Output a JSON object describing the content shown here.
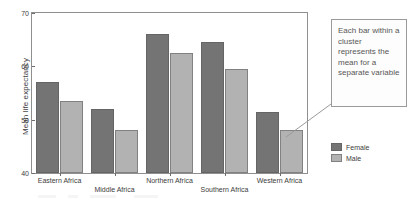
{
  "chart_data": {
    "type": "bar",
    "title": "",
    "subtitle": "",
    "xlabel": "",
    "ylabel": "Mean life expectancy",
    "ylim": [
      40,
      70
    ],
    "yticks": [
      40,
      50,
      60,
      70
    ],
    "ytick_labels": [
      "40",
      "50",
      "60",
      "70"
    ],
    "grid": false,
    "legend_position": "right",
    "categories": [
      "Eastern Africa",
      "Middle Africa",
      "Northern Africa",
      "Southern Africa",
      "Western Africa"
    ],
    "series": [
      {
        "name": "Female",
        "color": "#747474",
        "values": [
          57.0,
          52.0,
          66.0,
          64.5,
          51.5
        ]
      },
      {
        "name": "Male",
        "color": "#b2b2b2",
        "values": [
          53.5,
          48.0,
          62.5,
          59.5,
          48.0
        ]
      }
    ],
    "annotations": [
      {
        "text": "Each bar within a cluster represents the mean for a separate variable",
        "points_to": "Western Africa / Male bar"
      }
    ]
  },
  "axis": {
    "y_title": "Mean life expectancy",
    "y_tick_labels": [
      "70",
      "60",
      "50",
      "40"
    ]
  },
  "annotation": {
    "text": "Each bar within a cluster represents the mean for a separate variable"
  },
  "legend": {
    "items": [
      {
        "label": "Female",
        "color": "#747474"
      },
      {
        "label": "Male",
        "color": "#b2b2b2"
      }
    ]
  }
}
